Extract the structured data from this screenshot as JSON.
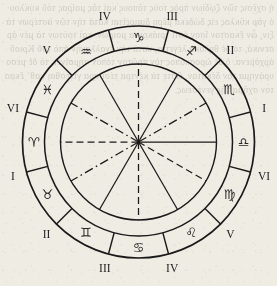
{
  "figure": {
    "center": {
      "x": 138.5,
      "y": 142
    },
    "radii": {
      "outer_ring": 116,
      "inner_ring": 94,
      "inner_circle": 78
    },
    "stroke_color": "#1a1a1a",
    "background_color": "#efece4",
    "sectors": [
      {
        "zodiac_name": "Sagittarius",
        "glyph": "♐",
        "numeral": "III",
        "angle_mid": -60,
        "numeral_angle": -75
      },
      {
        "zodiac_name": "Scorpio",
        "glyph": "♏",
        "numeral": "II",
        "angle_mid": -30,
        "numeral_angle": -45
      },
      {
        "zodiac_name": "Libra",
        "glyph": "♎",
        "numeral": "I",
        "angle_mid": 0,
        "numeral_angle": -15
      },
      {
        "zodiac_name": "Virgo",
        "glyph": "♍",
        "numeral": "VI",
        "angle_mid": 30,
        "numeral_angle": 15
      },
      {
        "zodiac_name": "Leo",
        "glyph": "♌",
        "numeral": "V",
        "angle_mid": 60,
        "numeral_angle": 45
      },
      {
        "zodiac_name": "Cancer",
        "glyph": "♋",
        "numeral": "IV",
        "angle_mid": 90,
        "numeral_angle": 75
      },
      {
        "zodiac_name": "Gemini",
        "glyph": "♊",
        "numeral": "III",
        "angle_mid": 120,
        "numeral_angle": 105
      },
      {
        "zodiac_name": "Taurus",
        "glyph": "♉",
        "numeral": "II",
        "angle_mid": 150,
        "numeral_angle": 135
      },
      {
        "zodiac_name": "Aries",
        "glyph": "♈",
        "numeral": "I",
        "angle_mid": 180,
        "numeral_angle": 165
      },
      {
        "zodiac_name": "Pisces",
        "glyph": "♓",
        "numeral": "VI",
        "angle_mid": 210,
        "numeral_angle": 195
      },
      {
        "zodiac_name": "Aquarius",
        "glyph": "♒",
        "numeral": "V",
        "angle_mid": 240,
        "numeral_angle": 225
      },
      {
        "zodiac_name": "Capricorn",
        "glyph": "♑",
        "numeral": "IV",
        "angle_mid": 270,
        "numeral_angle": 255
      }
    ],
    "spokes": [
      {
        "angle": 0,
        "style": "solid"
      },
      {
        "angle": 30,
        "style": "dashed"
      },
      {
        "angle": 60,
        "style": "solid"
      },
      {
        "angle": 90,
        "style": "dashed"
      },
      {
        "angle": 120,
        "style": "solid"
      },
      {
        "angle": 150,
        "style": "dashdot"
      },
      {
        "angle": 180,
        "style": "dashed"
      },
      {
        "angle": 210,
        "style": "dashdot"
      },
      {
        "angle": 240,
        "style": "solid"
      },
      {
        "angle": 270,
        "style": "dashed"
      },
      {
        "angle": 300,
        "style": "solid"
      },
      {
        "angle": 330,
        "style": "dashdot"
      }
    ],
    "divider_angles": [
      15,
      45,
      75,
      105,
      135,
      165,
      195,
      225,
      255,
      285,
      315,
      345
    ],
    "inner_divider_angles": [
      15,
      45,
      75,
      105,
      135,
      165,
      195,
      225,
      255,
      285,
      315,
      345
    ]
  },
  "bleed_text": "ἡ σχέσις τῶν ζῳδίων πρὸς τοὺς τόπους καὶ τὰς μοίρας τοῦ κύκλου· ὁ γὰρ κύκλος εἰς δώδεκα μέρη διαιρεῖται κατὰ τὴν τῶν ἀστέρων τάξιν, ὧν ἕκαστον ἴσον ἐστὶ τριάκοντα μοιρῶν. καὶ τούτων τὰ μὲν ἀρσενικά, τὰ δὲ θηλυκὰ λέγεται, κατὰ τὴν ἐναλλαγὴν ἀπὸ τοῦ Κριοῦ ἀρχόμενα. ὁ δὲ ὡροσκόπος τὸν πρῶτον τόπον σημαίνει, τὸ δὲ μεσουράνημα τὸν δέκατον, ὥστε τὰ κέντρα τέσσαρα γίνεσθαι καθ᾽ ἕκαστον σχῆμα τῆς γενέσεως."
}
